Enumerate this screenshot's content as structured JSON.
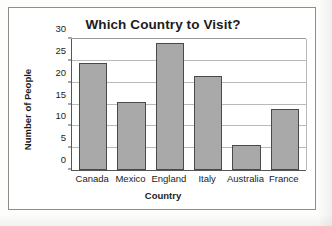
{
  "chart_data": {
    "type": "bar",
    "title": "Which Country to Visit?",
    "xlabel": "Country",
    "ylabel": "Number of People",
    "categories": [
      "Canada",
      "Mexico",
      "England",
      "Italy",
      "Australia",
      "France"
    ],
    "values": [
      24.5,
      15.5,
      29,
      21.5,
      5.7,
      14
    ],
    "ylim": [
      0,
      30
    ],
    "yticks": [
      0,
      5,
      10,
      15,
      20,
      25,
      30
    ],
    "ytick_labels": [
      "0",
      "5",
      "10",
      "15",
      "20",
      "25",
      "30"
    ],
    "grid": "horizontal",
    "legend": "none",
    "colors": {
      "bar_fill": "#a9a9a9",
      "bar_border": "#4a4a4a",
      "axis": "#555555",
      "gridline": "#b9b9b9",
      "text": "#1c1c1c",
      "frame": "#8d8d8d",
      "background": "#ffffff"
    }
  }
}
